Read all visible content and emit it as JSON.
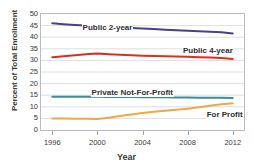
{
  "chart_data": {
    "type": "line",
    "title": "",
    "xlabel": "Year",
    "ylabel": "Percent of Total Enrollment",
    "xlim": [
      1995,
      2013
    ],
    "ylim": [
      0,
      50
    ],
    "yticks": [
      50,
      45,
      40,
      35,
      30,
      25,
      20,
      15,
      10,
      5,
      0
    ],
    "xticks": [
      1996,
      2000,
      2004,
      2008,
      2012
    ],
    "grid": true,
    "legend_position": "inline-annotations",
    "x": [
      1996,
      1997,
      1998,
      1999,
      2000,
      2001,
      2002,
      2003,
      2004,
      2005,
      2006,
      2007,
      2008,
      2009,
      2010,
      2011,
      2012
    ],
    "series": [
      {
        "name": "Public 2-year",
        "color": "#4c3f86",
        "values": [
          46.0,
          45.6,
          45.3,
          45.0,
          44.7,
          44.4,
          44.2,
          44.0,
          43.8,
          43.5,
          43.2,
          43.0,
          42.8,
          42.6,
          42.4,
          42.1,
          41.6
        ]
      },
      {
        "name": "Public 4-year",
        "color": "#e02b20",
        "values": [
          31.4,
          31.8,
          32.2,
          32.6,
          33.0,
          32.7,
          32.4,
          32.2,
          32.0,
          31.9,
          31.8,
          31.7,
          31.6,
          31.4,
          31.2,
          31.0,
          30.6
        ]
      },
      {
        "name": "Private Not-For-Profit",
        "color": "#3f8c93",
        "values": [
          14.3,
          14.3,
          14.3,
          14.3,
          14.3,
          14.2,
          14.2,
          14.2,
          14.1,
          14.1,
          14.1,
          14.0,
          14.0,
          13.9,
          13.9,
          13.9,
          13.8
        ]
      },
      {
        "name": "For Profit",
        "color": "#f0a64b",
        "values": [
          5.0,
          5.0,
          4.9,
          4.8,
          4.7,
          5.3,
          6.0,
          6.7,
          7.3,
          7.9,
          8.3,
          8.7,
          9.2,
          9.8,
          10.5,
          11.1,
          11.5
        ]
      }
    ],
    "annotations": [
      {
        "text": "Public 2-year",
        "x": 1998.6,
        "y": 44.0
      },
      {
        "text": "Public 4-year",
        "x": 2007.5,
        "y": 34.0
      },
      {
        "text": "Private Not-For-Profit",
        "x": 1999.4,
        "y": 16.0
      },
      {
        "text": "For Profit",
        "x": 2009.6,
        "y": 6.6
      }
    ]
  }
}
